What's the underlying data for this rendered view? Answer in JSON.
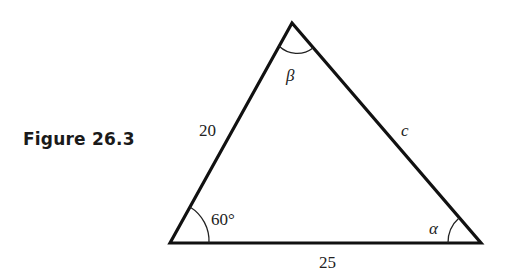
{
  "figure": {
    "caption": "Figure 26.3"
  },
  "triangle": {
    "vertices": {
      "bottom_left": [
        170,
        243
      ],
      "top": [
        292,
        23
      ],
      "bottom_right": [
        481,
        243
      ]
    },
    "sides": {
      "left": "20",
      "right": "c",
      "bottom": "25"
    },
    "angles": {
      "bottom_left": "60°",
      "top": "β",
      "bottom_right": "α"
    },
    "stroke_color": "#111111"
  }
}
